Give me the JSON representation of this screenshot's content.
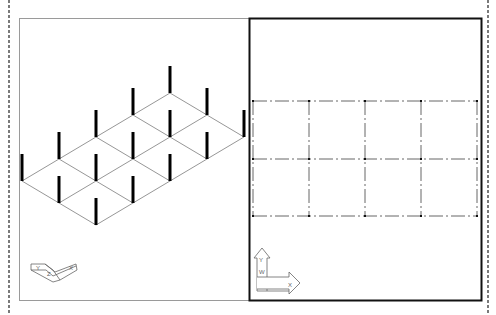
{
  "layout": {
    "title": "Multi-viewport CAD layout: isometric 3D view and plan view",
    "sheet_border_color": "#222222",
    "viewports": [
      {
        "id": "viewport-isometric",
        "label": "Isometric view",
        "active": false,
        "border_color": "#9a9a9a",
        "ucs_icon": {
          "labels": [
            "Y",
            "Z",
            "X"
          ]
        }
      },
      {
        "id": "viewport-plan",
        "label": "Plan view (WCS)",
        "active": true,
        "border_color": "#111111",
        "ucs_icon": {
          "labels": [
            "Y",
            "W",
            "X"
          ]
        }
      }
    ]
  },
  "model": {
    "description": "Structural column grid, 4 bays x 2 bays",
    "columns_x_count": 5,
    "columns_y_count": 3,
    "grid_line_style": "dash-dot",
    "grid_line_color": "#555555",
    "column_color": "#000000"
  }
}
